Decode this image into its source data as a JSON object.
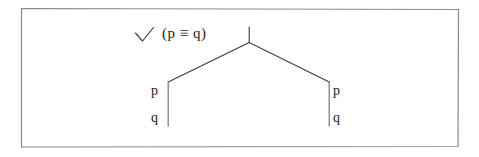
{
  "figure": {
    "kind": "semantic-tableau-tree",
    "border_color": "#8a8a8a",
    "line_color": "#3a3a3a",
    "text_color": "#1c1c1c",
    "background_color": "#ffffff",
    "check_mark": {
      "glyph": "check-mark",
      "label": "✓"
    },
    "formula": {
      "text": "(p ≡ q)",
      "connective": "≡",
      "left_operand": "p",
      "right_operand": "q"
    },
    "tree": {
      "root_stem": {
        "x": 249,
        "y_top": 27,
        "y_bottom": 42
      },
      "fork_apex": {
        "x": 249,
        "y": 42
      },
      "branches": [
        {
          "name": "left-branch",
          "end_x": 168,
          "end_y": 82,
          "stem_bottom_y": 126,
          "label_side": "left",
          "nodes": [
            "p",
            "q"
          ]
        },
        {
          "name": "right-branch",
          "end_x": 329,
          "end_y": 82,
          "stem_bottom_y": 126,
          "label_side": "right",
          "nodes": [
            "p",
            "q"
          ]
        }
      ]
    },
    "labels": {
      "left_p": "p",
      "left_q": "q",
      "right_p": "p",
      "right_q": "q"
    },
    "border_box": {
      "x1": 21,
      "y1": 8,
      "x2": 458,
      "y2": 147
    }
  }
}
